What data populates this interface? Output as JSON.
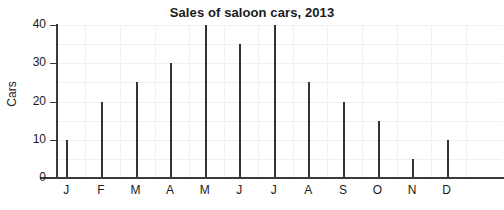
{
  "chart_data": {
    "type": "bar",
    "title": "Sales of saloon cars, 2013",
    "xlabel": "",
    "ylabel": "Cars",
    "categories": [
      "J",
      "F",
      "M",
      "A",
      "M",
      "J",
      "J",
      "A",
      "S",
      "O",
      "N",
      "D"
    ],
    "values": [
      10,
      20,
      25,
      30,
      40,
      35,
      40,
      25,
      20,
      15,
      5,
      10
    ],
    "ylim": [
      0,
      40
    ],
    "yticks": [
      0,
      10,
      20,
      30,
      40
    ],
    "ytick_labels": [
      "0",
      "10",
      "20",
      "30",
      "40"
    ],
    "grid": true,
    "grid_minor_step": 5,
    "legend": "none",
    "bar_color": "#333333",
    "gridline_color": "#efefef",
    "axis_color": "#3a3a3a",
    "text_color": "#1a1a1a",
    "background_color": "#ffffff"
  }
}
